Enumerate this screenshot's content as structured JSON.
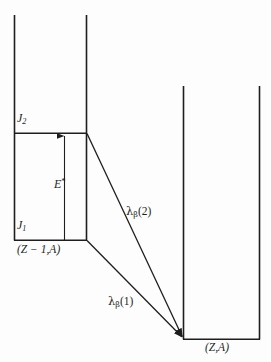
{
  "figure": {
    "type": "nuclear-level-diagram",
    "background_color": "#fdfdfd",
    "line_color": "#1e1e1e"
  },
  "labels": {
    "level_upper": "J",
    "level_upper_sub": "2",
    "level_lower": "J",
    "level_lower_sub": "1",
    "excitation_energy": "E",
    "excitation_energy_sup": "*",
    "parent_nucleus": "(Z − 1,A)",
    "daughter_nucleus": "(Z,A)",
    "decay_rate_2_symbol": "λ",
    "decay_rate_2_sub": "β",
    "decay_rate_2_arg": "(2)",
    "decay_rate_1_symbol": "λ",
    "decay_rate_1_sub": "β",
    "decay_rate_1_arg": "(1)"
  },
  "geometry": {
    "parent_well": {
      "left_x": 14,
      "right_x": 87,
      "top_y": 15,
      "level_j2_y": 133,
      "level_j1_y": 240
    },
    "daughter_well": {
      "left_x": 183,
      "right_x": 260,
      "top_y": 86,
      "ground_y": 339
    },
    "excitation_arrow": {
      "x": 64,
      "from_y": 240,
      "to_y": 134
    },
    "beta_arrow_2": {
      "from_x": 87,
      "from_y": 133,
      "to_x": 184,
      "to_y": 338
    },
    "beta_arrow_1": {
      "from_x": 87,
      "from_y": 240,
      "to_x": 184,
      "to_y": 338
    }
  }
}
